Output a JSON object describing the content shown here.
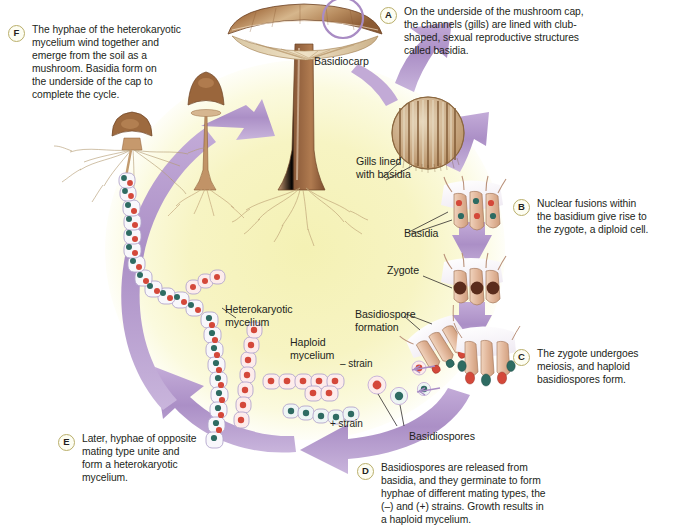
{
  "figure": {
    "background_color": "#ffffff",
    "cycle_center_color": "#f6f3bd",
    "cycle_outer_color": "#ffffff",
    "arrow_color": "#b095ca",
    "arrow_color_light": "#cdb9dd",
    "badge_border_color": "#b9ae6a",
    "text_color": "#231f20"
  },
  "callouts": [
    {
      "letter": "A",
      "text": "On the underside of the mushroom cap,\nthe channels (gills) are lined with club-\nshaped, sexual reproductive structures\ncalled basidia."
    },
    {
      "letter": "B",
      "text": "Nuclear fusions within\nthe basidium give rise to\nthe zygote, a diploid cell."
    },
    {
      "letter": "C",
      "text": "The zygote undergoes\nmeiosis, and haploid\nbasidiospores form."
    },
    {
      "letter": "D",
      "text": "Basidiospores are released from\nbasidia, and they germinate to form\nhyphae of different mating types, the\n(–) and (+) strains. Growth results in\na haploid mycelium."
    },
    {
      "letter": "E",
      "text": "Later, hyphae of opposite\nmating type unite and\nform a heterokaryotic\nmycelium."
    },
    {
      "letter": "F",
      "text": "The hyphae of the heterokaryotic\nmycelium wind together and\nemerge from the soil as a\nmushroom. Basidia form on\nthe underside of the cap to\ncomplete the cycle."
    }
  ],
  "structure_labels": [
    {
      "name": "basidiocarp",
      "text": "Basidiocarp"
    },
    {
      "name": "gills-lined-with-basidia",
      "text": "Gills lined\nwith basidia"
    },
    {
      "name": "basidia",
      "text": "Basidia"
    },
    {
      "name": "zygote",
      "text": "Zygote"
    },
    {
      "name": "basidiospore-formation",
      "text": "Basidiospore\nformation"
    },
    {
      "name": "basidiospores",
      "text": "Basidiospores"
    },
    {
      "name": "heterokaryotic-mycelium",
      "text": "Heterokaryotic\nmycelium"
    },
    {
      "name": "haploid-mycelium",
      "text": "Haploid\nmycelium"
    },
    {
      "name": "minus-strain",
      "text": "– strain"
    },
    {
      "name": "plus-strain",
      "text": "+ strain"
    }
  ]
}
